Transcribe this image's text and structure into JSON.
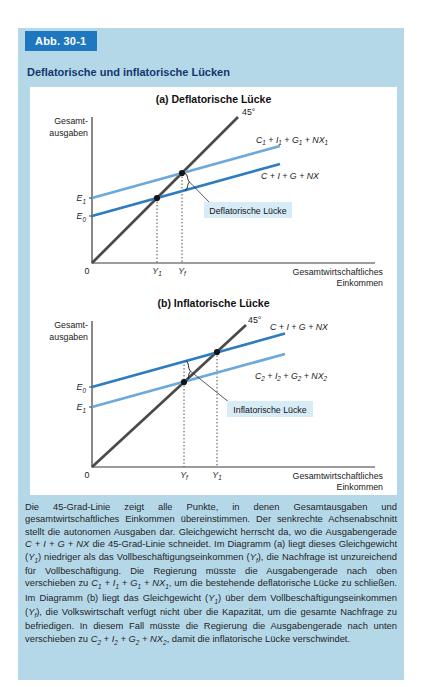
{
  "figure": {
    "tag": "Abb. 30-1",
    "title": "Deflatorische und inflatorische Lücken"
  },
  "colors": {
    "card_bg": "#b5d8e9",
    "tag_bg": "#1e78bf",
    "tag_text": "#ffffff",
    "title_text": "#14376b",
    "panel_bg": "#ffffff",
    "line45": "#4a4a4a",
    "dark": "#2d7cc0",
    "light": "#6ca9db",
    "callout_bg": "#d8ecf8",
    "axis": "#3a3a3a",
    "dotted": "#444444",
    "label": "#222222",
    "point": "#151515"
  },
  "chart_data": [
    {
      "type": "line",
      "panel": "(a) Deflatorische Lücke",
      "xlabel": [
        "Gesamtwirtschaftliches",
        "Einkommen"
      ],
      "ylabel": [
        "Gesamt-",
        "ausgaben"
      ],
      "origin_label": "0",
      "axes": {
        "ox": 62,
        "oy": 158,
        "xend": 345,
        "ytop": 12
      },
      "deg45": {
        "label": "45°",
        "x1": 62,
        "y1": 158,
        "x2": 208,
        "y2": 12,
        "label_x": 212,
        "label_y": 10
      },
      "lines": [
        {
          "name": "C_1 + I_1 + G_1 + NX_1",
          "color_key": "light",
          "x1": 62,
          "y1": 93,
          "x2": 250,
          "y2": 41,
          "label_x": 226,
          "label_y": 38
        },
        {
          "name": "C + I + G + NX",
          "color_key": "dark",
          "x1": 62,
          "y1": 111,
          "x2": 250,
          "y2": 59,
          "label_x": 231,
          "label_y": 74
        }
      ],
      "points": [
        {
          "x": 127,
          "y": 93
        },
        {
          "x": 152,
          "y": 68
        }
      ],
      "x_ticks": [
        {
          "label": "Y_1",
          "x": 127,
          "drop_from": 93
        },
        {
          "label": "Y_f",
          "x": 152,
          "drop_from": 68
        }
      ],
      "y_ticks": [
        {
          "label": "E_1",
          "y": 93
        },
        {
          "label": "E_0",
          "y": 111
        }
      ],
      "gap": {
        "callout": "Deflatorische Lücke",
        "x": 155,
        "y_top": 68.5,
        "y_bottom": 85.5,
        "pointer": [
          159.5,
          77,
          180,
          98
        ],
        "box": [
          174,
          97,
          88,
          16
        ]
      }
    },
    {
      "type": "line",
      "panel": "(b) Inflatorische Lücke",
      "xlabel": [
        "Gesamtwirtschaftliches",
        "Einkommen"
      ],
      "ylabel": [
        "Gesamt-",
        "ausgaben"
      ],
      "origin_label": "0",
      "axes": {
        "ox": 62,
        "oy": 158,
        "xend": 345,
        "ytop": 12
      },
      "deg45": {
        "label": "45°",
        "x1": 62,
        "y1": 158,
        "x2": 216,
        "y2": 16,
        "label_x": 218,
        "label_y": 14
      },
      "lines": [
        {
          "name": "C + I + G + NX",
          "color_key": "dark",
          "x1": 62,
          "y1": 78,
          "x2": 255,
          "y2": 24.5,
          "label_x": 240,
          "label_y": 21
        },
        {
          "name": "C_2 + I_2 + G_2 + NX_2",
          "color_key": "light",
          "x1": 62,
          "y1": 98,
          "x2": 255,
          "y2": 45,
          "label_x": 225,
          "label_y": 70
        }
      ],
      "points": [
        {
          "x": 154,
          "y": 73
        },
        {
          "x": 187,
          "y": 43
        }
      ],
      "x_ticks": [
        {
          "label": "Y_f",
          "x": 154,
          "drop_from": 52
        },
        {
          "label": "Y_1",
          "x": 187,
          "drop_from": 43
        }
      ],
      "y_ticks": [
        {
          "label": "E_0",
          "y": 78
        },
        {
          "label": "E_1",
          "y": 98
        }
      ],
      "gap": {
        "callout": "Inflatorische Lücke",
        "x": 156,
        "y_top": 52,
        "y_bottom": 72.5,
        "pointer": [
          160.5,
          62.25,
          200,
          94
        ],
        "box": [
          197,
          92,
          86,
          16
        ]
      }
    }
  ],
  "caption_runs": [
    {
      "t": "Die 45-Grad-Linie zeigt alle Punkte, in denen Gesamtausgaben und gesamtwirtschaftliches Einkommen übereinstimmen. Der senkrechte Achsenabschnitt stellt die autonomen Ausgaben dar. Gleichgewicht herrscht da, wo die Ausgabengerade "
    },
    {
      "t": "C + I + G + NX",
      "math": true
    },
    {
      "t": " die 45-Grad-Linie schneidet. Im Diagramm (a) liegt dieses Gleichgewicht ("
    },
    {
      "t": "Y_1",
      "math": true
    },
    {
      "t": ") niedriger als das Vollbeschäftigungseinkommen ("
    },
    {
      "t": "Y_f",
      "math": true
    },
    {
      "t": "), die Nachfrage ist unzureichend für Vollbeschäftigung. Die Regierung müsste die Ausgabengerade nach oben verschieben zu "
    },
    {
      "t": "C_1 + I_1 + G_1 + NX_1",
      "math": true
    },
    {
      "t": ", um die bestehende deflatorische Lücke zu schließen. Im Diagramm (b) liegt das Gleichgewicht ("
    },
    {
      "t": "Y_1",
      "math": true
    },
    {
      "t": ") über dem Vollbeschäftigungseinkommen ("
    },
    {
      "t": "Y_f",
      "math": true
    },
    {
      "t": "), die Volkswirtschaft verfügt nicht über die Kapazität, um die gesamte Nachfrage zu befriedigen. In diesem Fall müsste die Regierung die Ausgabengerade nach unten verschieben zu "
    },
    {
      "t": "C_2 + I_2 + G_2 + NX_2",
      "math": true
    },
    {
      "t": ", damit die inflatorische Lücke verschwindet."
    }
  ]
}
